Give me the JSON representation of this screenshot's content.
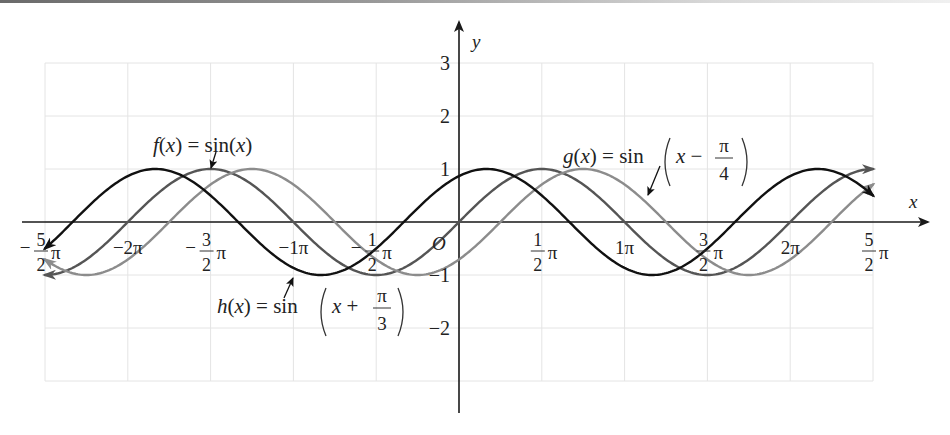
{
  "chart_data": {
    "type": "line",
    "title": "",
    "xlabel": "x",
    "ylabel": "y",
    "origin_label": "O",
    "xlim_pi": [
      -2.5,
      2.5
    ],
    "ylim": [
      -3,
      3
    ],
    "grid": true,
    "legend": "inline annotations with arrows",
    "x_ticks": [
      {
        "value_pi": -2.5,
        "whole": "",
        "num": "5",
        "den": "2",
        "neg": true,
        "suffix": "π"
      },
      {
        "value_pi": -2.0,
        "text": "−2π"
      },
      {
        "value_pi": -1.5,
        "whole": "",
        "num": "3",
        "den": "2",
        "neg": true,
        "suffix": "π"
      },
      {
        "value_pi": -1.0,
        "text": "−1π"
      },
      {
        "value_pi": -0.5,
        "whole": "",
        "num": "1",
        "den": "2",
        "neg": true,
        "suffix": "π"
      },
      {
        "value_pi": 0.5,
        "whole": "",
        "num": "1",
        "den": "2",
        "neg": false,
        "suffix": "π"
      },
      {
        "value_pi": 1.0,
        "text": "1π"
      },
      {
        "value_pi": 1.5,
        "whole": "",
        "num": "3",
        "den": "2",
        "neg": false,
        "suffix": "π"
      },
      {
        "value_pi": 2.0,
        "text": "2π"
      },
      {
        "value_pi": 2.5,
        "whole": "",
        "num": "5",
        "den": "2",
        "neg": false,
        "suffix": "π"
      }
    ],
    "y_ticks": [
      {
        "value": 3,
        "text": "3"
      },
      {
        "value": 2,
        "text": "2"
      },
      {
        "value": 1,
        "text": "1"
      },
      {
        "value": -1,
        "text": "−1"
      },
      {
        "value": -2,
        "text": "−2"
      }
    ],
    "series": [
      {
        "name": "f(x) = sin(x)",
        "expression": "sin(x)",
        "phase_shift": 0,
        "color": "#555555",
        "label": {
          "prefix": "f(x) = sin(x)",
          "frac": null
        },
        "x_pi": [
          -2.5,
          -2.0,
          -1.5,
          -1.0,
          -0.5,
          0,
          0.5,
          1.0,
          1.5,
          2.0,
          2.5
        ],
        "y": [
          -1,
          0,
          1,
          0,
          -1,
          0,
          1,
          0,
          -1,
          0,
          1
        ]
      },
      {
        "name": "g(x) = sin(x − π/4)",
        "expression": "sin(x - pi/4)",
        "phase_shift": -0.7853981634,
        "color": "#8c8c8c",
        "label": {
          "prefix": "g(x) = sin",
          "inner": "x −",
          "frac_num": "π",
          "frac_den": "4"
        },
        "x_pi": [
          -2.5,
          -2.0,
          -1.5,
          -1.0,
          -0.5,
          0,
          0.5,
          1.0,
          1.5,
          2.0,
          2.5
        ],
        "y": [
          -0.707,
          0.707,
          0.707,
          -0.707,
          -0.707,
          -0.707,
          0.707,
          0.707,
          -0.707,
          -0.707,
          0.707
        ]
      },
      {
        "name": "h(x) = sin(x + π/3)",
        "expression": "sin(x + pi/3)",
        "phase_shift": 1.0471975512,
        "color": "#111111",
        "label": {
          "prefix": "h(x) = sin",
          "inner": "x +",
          "frac_num": "π",
          "frac_den": "3"
        },
        "x_pi": [
          -2.5,
          -2.0,
          -1.5,
          -1.0,
          -0.5,
          0,
          0.5,
          1.0,
          1.5,
          2.0,
          2.5
        ],
        "y": [
          -0.5,
          0.866,
          0.5,
          -0.866,
          -0.5,
          0.866,
          0.5,
          -0.866,
          -0.5,
          0.866,
          0.5
        ]
      }
    ]
  },
  "labels": {
    "f_text": "f(x) = sin(x)",
    "g_prefix": "g(x) = sin",
    "g_inner": "x −",
    "g_num": "π",
    "g_den": "4",
    "h_prefix": "h(x) = sin",
    "h_inner": "x +",
    "h_num": "π",
    "h_den": "3",
    "x_axis": "x",
    "y_axis": "y",
    "origin": "O"
  }
}
